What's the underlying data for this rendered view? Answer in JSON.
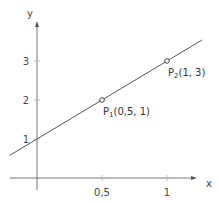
{
  "chart_data": {
    "type": "line",
    "title": "",
    "xlabel": "x",
    "ylabel": "y",
    "xlim": [
      -0.21,
      1.27
    ],
    "ylim": [
      -0.3,
      3.9
    ],
    "xticks": [
      {
        "value": 0.5,
        "label": "0,5"
      },
      {
        "value": 1,
        "label": "1"
      }
    ],
    "yticks": [
      {
        "value": 1,
        "label": "1"
      },
      {
        "value": 2,
        "label": "2"
      },
      {
        "value": 3,
        "label": "3"
      }
    ],
    "series": [
      {
        "name": "line",
        "equation": "y = 2x + 1",
        "x": [
          -0.21,
          1.27
        ],
        "y": [
          0.58,
          3.54
        ]
      }
    ],
    "points": [
      {
        "name": "P1",
        "sub": "1",
        "x": 0.5,
        "y": 2,
        "label_main": "P",
        "label_coords": "(0,5, 1)"
      },
      {
        "name": "P2",
        "sub": "2",
        "x": 1,
        "y": 3,
        "label_main": "P",
        "label_coords": "(1, 3)"
      }
    ],
    "grid": false,
    "legend": "none"
  }
}
